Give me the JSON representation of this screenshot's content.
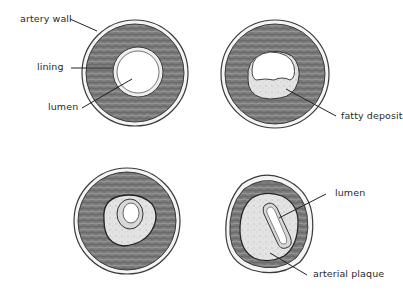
{
  "diagram": {
    "panels": [
      {
        "id": "healthy",
        "labels": [
          "artery wall",
          "lining",
          "lumen"
        ]
      },
      {
        "id": "early",
        "labels": [
          "fatty deposit"
        ]
      },
      {
        "id": "narrowed",
        "labels": []
      },
      {
        "id": "blocked",
        "labels": [
          "lumen",
          "arterial plaque"
        ]
      }
    ]
  },
  "colors": {
    "wall": "#6f6f6f",
    "wall_light": "#a9a9a9",
    "outline": "#3a3a3a",
    "plaque": "#dcdcdc",
    "background": "#ffffff"
  }
}
